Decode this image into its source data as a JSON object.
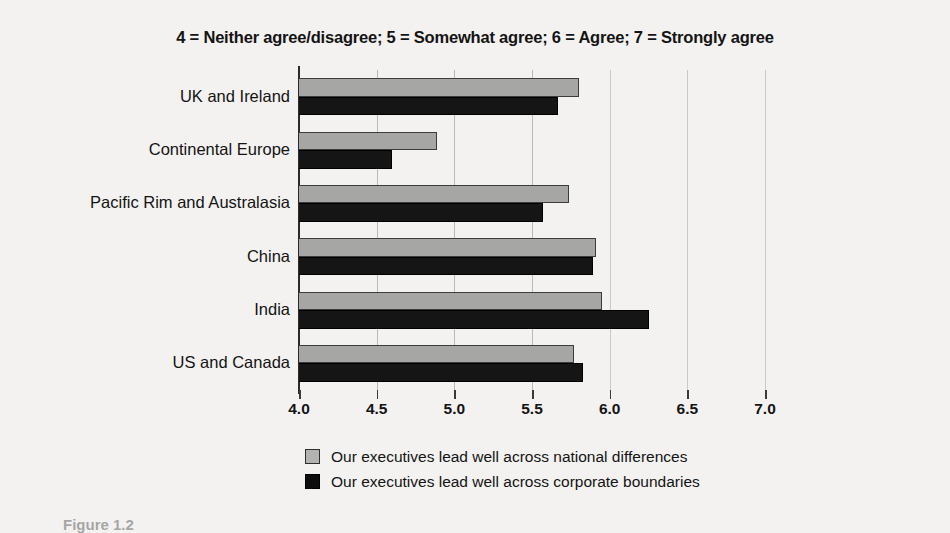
{
  "chart_data": {
    "type": "bar",
    "orientation": "horizontal",
    "title": "4 = Neither agree/disagree; 5 = Somewhat agree; 6 = Agree; 7 = Strongly agree",
    "xlabel": "",
    "ylabel": "",
    "xlim": [
      4.0,
      7.0
    ],
    "xticks": [
      "4.0",
      "4.5",
      "5.0",
      "5.5",
      "6.0",
      "6.5",
      "7.0"
    ],
    "xtick_values": [
      4.0,
      4.5,
      5.0,
      5.5,
      6.0,
      6.5,
      7.0
    ],
    "grid": true,
    "legend_position": "bottom",
    "categories": [
      "UK and Ireland",
      "Continental Europe",
      "Pacific Rim and Australasia",
      "China",
      "India",
      "US and Canada"
    ],
    "series": [
      {
        "name": "Our executives lead well across national differences",
        "color": "#a6a6a4",
        "values": [
          5.8,
          4.89,
          5.74,
          5.91,
          5.95,
          5.77
        ]
      },
      {
        "name": "Our executives lead well across corporate boundaries",
        "color": "#151515",
        "values": [
          5.67,
          4.6,
          5.57,
          5.89,
          6.25,
          5.83
        ]
      }
    ]
  },
  "caption": "Figure 1.2",
  "colors": {
    "background": "#f3f2f0",
    "axis": "#2a2a2a",
    "gridline": "#c9c9c7",
    "text": "#141414"
  }
}
